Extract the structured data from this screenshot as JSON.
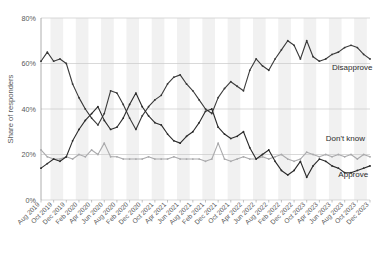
{
  "chart_data": {
    "type": "line",
    "title": "",
    "xlabel": "",
    "ylabel": "Share of responders",
    "ylim": [
      0,
      80
    ],
    "ytick_labels": [
      "0%",
      "20%",
      "40%",
      "60%",
      "80%"
    ],
    "ytick_values": [
      0,
      20,
      40,
      60,
      80
    ],
    "grid": "horizontal",
    "background_bands": "alternating vertical light-gray stripes",
    "legend_position": "inline-right-of-series",
    "x": [
      "Aug 2019",
      "Sep 2019",
      "Oct 2019",
      "Nov 2019",
      "Dec 2019",
      "Jan 2020",
      "Feb 2020",
      "Mar 2020",
      "Apr 2020",
      "May 2020",
      "Jun 2020",
      "Jul 2020",
      "Aug 2020",
      "Sep 2020",
      "Oct 2020",
      "Nov 2020",
      "Dec 2020",
      "Jan 2021",
      "Feb 2021",
      "Mar 2021",
      "Apr 2021",
      "May 2021",
      "Jun 2021",
      "Jul 2021",
      "Aug 2021",
      "Sep 2021",
      "Oct 2021",
      "Nov 2021",
      "Dec 2021",
      "Jan 2022",
      "Feb 2022",
      "Mar 2022",
      "Apr 2022",
      "May 2022",
      "Jun 2022",
      "Jul 2022",
      "Aug 2022",
      "Sep 2022",
      "Oct 2022",
      "Nov 2022",
      "Dec 2022",
      "Jan 2023",
      "Feb 2023",
      "Mar 2023",
      "Apr 2023",
      "May 2023",
      "Jun 2023",
      "Jul 2023",
      "Aug 2023",
      "Sep 2023",
      "Oct 2023",
      "Nov 2023",
      "Dec 2023"
    ],
    "xtick_labels": [
      "Aug 2019",
      "Oct 2019",
      "Dec 2019",
      "Feb 2020",
      "Apr 2020",
      "Jun 2020",
      "Aug 2020",
      "Feb 2020",
      "Dec 2020",
      "Oct 2021",
      "Apr 2021",
      "Jun 2021",
      "Aug 2021",
      "Feb 2021",
      "Dec 2021",
      "Oct 2021",
      "Apr 2022",
      "Jun 2022",
      "Aug 2022",
      "Feb 2022",
      "Dec 2022",
      "Oct 2023",
      "Apr 2023",
      "Jun 2023",
      "Aug 2023",
      "Oct 2023",
      "Dec 2023"
    ],
    "xtick_indices": [
      0,
      2,
      4,
      6,
      8,
      10,
      12,
      14,
      16,
      18,
      20,
      22,
      24,
      26,
      28,
      30,
      32,
      34,
      36,
      38,
      40,
      42,
      44,
      46,
      48,
      50,
      52
    ],
    "series": [
      {
        "name": "Disapprove",
        "color": "#3a3a3a",
        "label_x_index": 46,
        "label_y": 57,
        "values": [
          61,
          65,
          61,
          62,
          60,
          51,
          45,
          40,
          36,
          33,
          38,
          48,
          47,
          42,
          36,
          31,
          37,
          41,
          44,
          46,
          51,
          54,
          55,
          51,
          48,
          44,
          40,
          38,
          45,
          49,
          52,
          50,
          48,
          57,
          62,
          59,
          57,
          62,
          66,
          70,
          68,
          62,
          70,
          63,
          61,
          62,
          64,
          65,
          67,
          68,
          67,
          64,
          62
        ]
      },
      {
        "name": "Don't know",
        "color": "#aaaaac",
        "label_x_index": 45,
        "label_y": 26,
        "values": [
          22,
          19,
          18,
          18,
          19,
          18,
          20,
          19,
          22,
          20,
          25,
          19,
          19,
          18,
          18,
          18,
          18,
          19,
          18,
          18,
          18,
          19,
          18,
          18,
          18,
          18,
          17,
          18,
          25,
          18,
          17,
          18,
          19,
          18,
          18,
          19,
          18,
          19,
          20,
          18,
          17,
          18,
          21,
          20,
          19,
          20,
          19,
          20,
          19,
          20,
          18,
          20,
          19
        ]
      },
      {
        "name": "Approve",
        "color": "#2b2b2b",
        "label_x_index": 47,
        "label_y": 10,
        "values": [
          14,
          16,
          18,
          17,
          19,
          26,
          31,
          35,
          38,
          41,
          35,
          31,
          32,
          36,
          42,
          47,
          41,
          37,
          34,
          33,
          29,
          26,
          25,
          28,
          30,
          34,
          39,
          40,
          32,
          29,
          27,
          28,
          30,
          23,
          18,
          20,
          22,
          17,
          13,
          11,
          13,
          17,
          10,
          15,
          18,
          17,
          15,
          14,
          12,
          12,
          13,
          14,
          15
        ]
      }
    ]
  }
}
